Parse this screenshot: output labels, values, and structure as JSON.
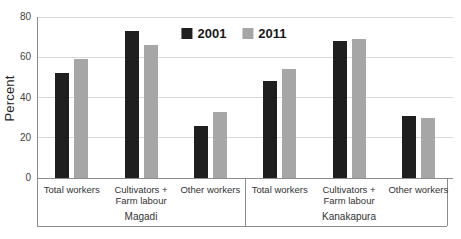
{
  "chart_data": {
    "type": "bar",
    "title": "",
    "ylabel": "Percent",
    "ylim": [
      0,
      80
    ],
    "yticks": [
      0,
      20,
      40,
      60,
      80
    ],
    "grid": true,
    "legend_position": "top-center",
    "group_labels": [
      "Magadi",
      "Kanakapura"
    ],
    "category_labels": [
      [
        "Total workers"
      ],
      [
        "Cultivators +",
        "Farm labour"
      ],
      [
        "Other workers"
      ],
      [
        "Total workers"
      ],
      [
        "Cultivators +",
        "Farm labour"
      ],
      [
        "Other workers"
      ]
    ],
    "series": [
      {
        "name": "2001",
        "color": "#1f1f1f",
        "values": [
          52,
          73,
          26,
          48,
          68,
          31
        ]
      },
      {
        "name": "2011",
        "color": "#a6a6a6",
        "values": [
          59,
          66,
          33,
          54,
          69,
          30
        ]
      }
    ],
    "colors": {
      "gridline": "#d9d9d9",
      "axis": "#8c8c8c",
      "tick_text": "#3f3f3f"
    }
  }
}
